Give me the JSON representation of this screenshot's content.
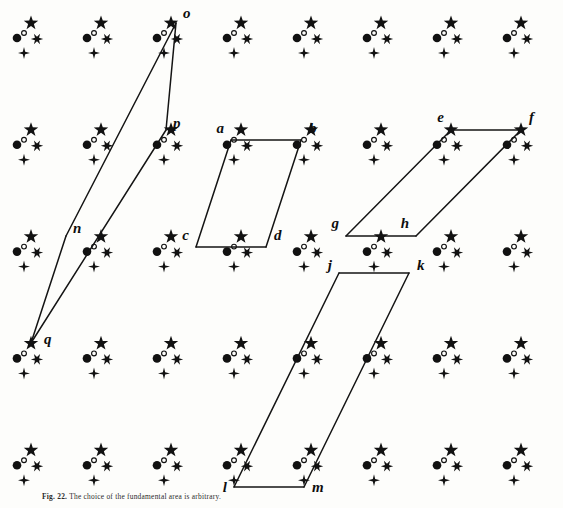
{
  "figure": {
    "caption_prefix": "Fig. 22.",
    "caption_text": "The choice of the fundamental area is arbitrary.",
    "width": 563,
    "height": 508,
    "ink_color": "#111111",
    "background_color": "#fdfdfb"
  },
  "lattice": {
    "origin_x": 31,
    "origin_y": 23,
    "spacing_x": 70,
    "spacing_y": 106.8,
    "cols": 8,
    "rows": 5,
    "motif": [
      {
        "name": "star-glyph",
        "kind": "star5",
        "dx": 0,
        "dy": 0,
        "size": 7.6
      },
      {
        "name": "filled-circle",
        "kind": "disc",
        "dx": -14,
        "dy": 15,
        "size": 4.3
      },
      {
        "name": "small-open-circle",
        "kind": "circle",
        "dx": -7,
        "dy": 10,
        "size": 2.4
      },
      {
        "name": "asterisk-glyph",
        "kind": "star6",
        "dx": 6,
        "dy": 16,
        "size": 6.2
      },
      {
        "name": "plus-star-glyph",
        "kind": "star4",
        "dx": -7,
        "dy": 30,
        "size": 6.0
      }
    ]
  },
  "cells": [
    {
      "id": "abcd",
      "name": "unit-cell-abcd",
      "stroke_width": 1.5,
      "vertices": [
        {
          "label": "a",
          "x": 231,
          "y": 140,
          "lx": 224,
          "ly": 133,
          "anchor": "end"
        },
        {
          "label": "b",
          "x": 301,
          "y": 140,
          "lx": 309,
          "ly": 133,
          "anchor": "start"
        },
        {
          "label": "d",
          "x": 266,
          "y": 247,
          "lx": 274,
          "ly": 240,
          "anchor": "start"
        },
        {
          "label": "c",
          "x": 196,
          "y": 247,
          "lx": 189,
          "ly": 240,
          "anchor": "end"
        }
      ]
    },
    {
      "id": "efgh",
      "name": "unit-cell-efgh",
      "stroke_width": 1.5,
      "vertices": [
        {
          "label": "e",
          "x": 451,
          "y": 130,
          "lx": 444,
          "ly": 122,
          "anchor": "end"
        },
        {
          "label": "f",
          "x": 521,
          "y": 130,
          "lx": 529,
          "ly": 122,
          "anchor": "start"
        },
        {
          "label": "h",
          "x": 416,
          "y": 236,
          "lx": 409,
          "ly": 228,
          "anchor": "end"
        },
        {
          "label": "g",
          "x": 346,
          "y": 236,
          "lx": 339,
          "ly": 228,
          "anchor": "end"
        }
      ]
    },
    {
      "id": "jklm",
      "name": "unit-cell-jklm",
      "stroke_width": 1.5,
      "vertices": [
        {
          "label": "j",
          "x": 339,
          "y": 273,
          "lx": 332,
          "ly": 270,
          "anchor": "end"
        },
        {
          "label": "k",
          "x": 409,
          "y": 273,
          "lx": 417,
          "ly": 270,
          "anchor": "start"
        },
        {
          "label": "m",
          "x": 304,
          "y": 487,
          "lx": 312,
          "ly": 492,
          "anchor": "start"
        },
        {
          "label": "l",
          "x": 234,
          "y": 487,
          "lx": 227,
          "ly": 492,
          "anchor": "end"
        }
      ]
    },
    {
      "id": "nopq",
      "name": "unit-cell-nopq",
      "stroke_width": 1.5,
      "vertices": [
        {
          "label": "o",
          "x": 176,
          "y": 23,
          "lx": 183,
          "ly": 18,
          "anchor": "start"
        },
        {
          "label": "p",
          "x": 166,
          "y": 130,
          "lx": 173,
          "ly": 128,
          "anchor": "start"
        },
        {
          "label": "n",
          "x": 66,
          "y": 236,
          "lx": 73,
          "ly": 233,
          "anchor": "start"
        },
        {
          "label": "q",
          "x": 31,
          "y": 343,
          "lx": 44,
          "ly": 344,
          "anchor": "start"
        }
      ],
      "edges": [
        [
          0,
          1
        ],
        [
          1,
          3
        ],
        [
          3,
          2
        ],
        [
          2,
          0
        ]
      ]
    }
  ]
}
